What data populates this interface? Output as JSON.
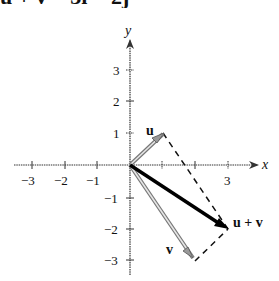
{
  "title": "u + v = 3i − 2j",
  "axes": {
    "x_label": "x",
    "y_label": "y",
    "x_ticks": [
      {
        "value": -3,
        "label": "−3"
      },
      {
        "value": -2,
        "label": "−2"
      },
      {
        "value": -1,
        "label": "−1"
      },
      {
        "value": 1,
        "label": ""
      },
      {
        "value": 2,
        "label": ""
      },
      {
        "value": 3,
        "label": "3"
      }
    ],
    "y_ticks": [
      {
        "value": 3,
        "label": "3"
      },
      {
        "value": 2,
        "label": "2"
      },
      {
        "value": 1,
        "label": "1"
      },
      {
        "value": -1,
        "label": "−1"
      },
      {
        "value": -2,
        "label": "−2"
      },
      {
        "value": -3,
        "label": "−3"
      }
    ]
  },
  "vectors": {
    "u": {
      "label": "u",
      "x": 1,
      "y": 1,
      "color": "#8a8a8a"
    },
    "v": {
      "label": "v",
      "x": 2,
      "y": -3,
      "color": "#8a8a8a"
    },
    "sum": {
      "label": "u + v",
      "x": 3,
      "y": -2,
      "color": "#000000"
    }
  },
  "colors": {
    "axis": "#333333",
    "dashed": "#111111"
  }
}
